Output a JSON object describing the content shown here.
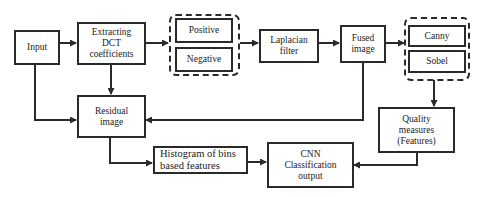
{
  "diagram": {
    "nodes": {
      "input": {
        "label": "Input"
      },
      "dct": {
        "label": "Extracting DCT coefficients"
      },
      "positive": {
        "label": "Positive"
      },
      "negative": {
        "label": "Negative"
      },
      "laplacian": {
        "label": "Laplacian filter"
      },
      "fused": {
        "label": "Fused image"
      },
      "canny": {
        "label": "Canny"
      },
      "sobel": {
        "label": "Sobel"
      },
      "residual": {
        "label": "Residual image"
      },
      "quality": {
        "label": "Quality measures (Features)"
      },
      "histogram": {
        "label": "Histogram of bins based features"
      },
      "cnn": {
        "label": "CNN Classification output"
      }
    },
    "groups": [
      {
        "name": "dct-sign-group",
        "members": [
          "positive",
          "negative"
        ]
      },
      {
        "name": "edge-detector-group",
        "members": [
          "canny",
          "sobel"
        ]
      }
    ],
    "edges": [
      {
        "from": "input",
        "to": "dct"
      },
      {
        "from": "dct",
        "to": "dct-sign-group"
      },
      {
        "from": "dct-sign-group",
        "to": "laplacian"
      },
      {
        "from": "laplacian",
        "to": "fused"
      },
      {
        "from": "fused",
        "to": "edge-detector-group"
      },
      {
        "from": "input",
        "to": "residual"
      },
      {
        "from": "dct",
        "to": "residual"
      },
      {
        "from": "fused",
        "to": "residual"
      },
      {
        "from": "edge-detector-group",
        "to": "quality"
      },
      {
        "from": "residual",
        "to": "histogram"
      },
      {
        "from": "histogram",
        "to": "cnn"
      },
      {
        "from": "quality",
        "to": "cnn"
      }
    ],
    "colors": {
      "stroke": "#2a2a2a",
      "background": "#ffffff"
    }
  }
}
